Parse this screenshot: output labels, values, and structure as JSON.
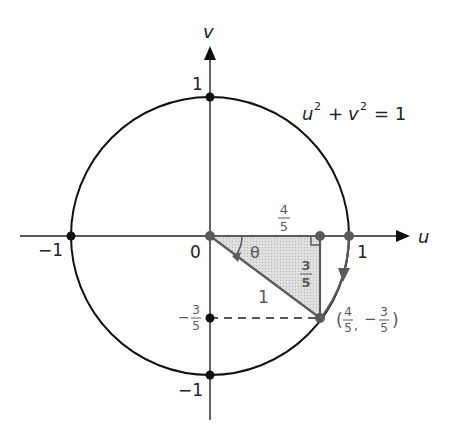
{
  "diagram": {
    "type": "unit-circle",
    "axes": {
      "horizontal_label": "u",
      "vertical_label": "v"
    },
    "equation": {
      "u": "u",
      "v": "v",
      "exp": "2",
      "plus": "+",
      "equals": "= 1"
    },
    "tick_labels": {
      "u_pos_one": "1",
      "u_neg_one": "−1",
      "v_pos_one": "1",
      "v_neg_one": "−1",
      "origin": "0"
    },
    "triangle": {
      "horizontal_side": {
        "num": "4",
        "den": "5"
      },
      "vertical_side": {
        "num": "3",
        "den": "5"
      },
      "hypotenuse": "1",
      "angle": "θ"
    },
    "point": {
      "open": "(",
      "x_num": "4",
      "x_den": "5",
      "comma": ",",
      "minus": "−",
      "y_num": "3",
      "y_den": "5",
      "close": ")"
    },
    "v_marker": {
      "minus": "−",
      "num": "3",
      "den": "5"
    },
    "colors": {
      "line": "#111111",
      "highlight": "#5a5a5a",
      "shade": "#d4d4d4"
    }
  }
}
